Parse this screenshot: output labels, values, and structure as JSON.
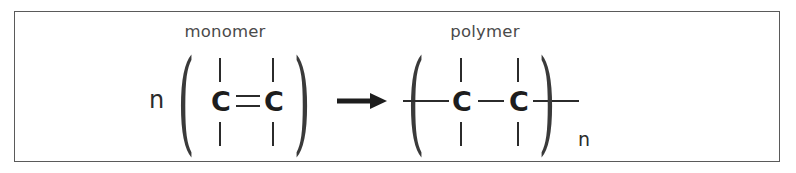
{
  "figure": {
    "kind": "chemical-equation",
    "background_color": "#ffffff",
    "border_color": "#5a5a5a",
    "ink_color": "#2b2b2b",
    "label_color": "#4a4a4a"
  },
  "labels": {
    "monomer": "monomer",
    "polymer": "polymer"
  },
  "monomer": {
    "coefficient": "n",
    "open_paren": "(",
    "close_paren": ")",
    "left_atom": "C",
    "right_atom": "C",
    "bond_between_atoms": "=",
    "bond_order": 2,
    "substituent_bonds": [
      "up-left",
      "down-left",
      "up-right",
      "down-right"
    ]
  },
  "polymer": {
    "open_paren": "(",
    "close_paren": ")",
    "left_atom": "C",
    "right_atom": "C",
    "bond_between_atoms": "-",
    "bond_order": 1,
    "repeat_subscript": "n",
    "chain_continuation_bonds": [
      "left",
      "right"
    ],
    "substituent_bonds": [
      "up-left",
      "down-left",
      "up-right",
      "down-right"
    ]
  },
  "arrow": {
    "icon": "right-arrow-icon",
    "direction": "right",
    "meaning": "reacts to form"
  }
}
